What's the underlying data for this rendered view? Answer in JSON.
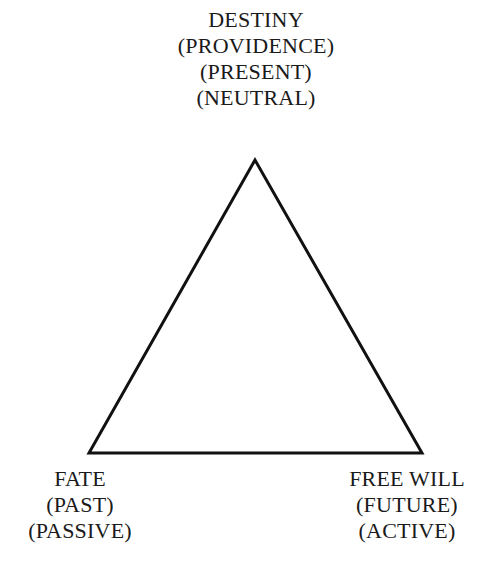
{
  "diagram": {
    "type": "triangle",
    "vertices": {
      "top": {
        "lines": [
          "DESTINY",
          "(PROVIDENCE)",
          "(PRESENT)",
          "(NEUTRAL)"
        ]
      },
      "bottom_left": {
        "lines": [
          "FATE",
          "(PAST)",
          "(PASSIVE)"
        ]
      },
      "bottom_right": {
        "lines": [
          "FREE WILL",
          "(FUTURE)",
          "(ACTIVE)"
        ]
      }
    },
    "stroke_color": "#111111",
    "text_color": "#1a1a1a",
    "background": "#ffffff"
  }
}
